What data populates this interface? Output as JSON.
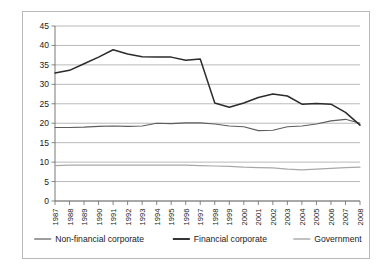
{
  "chart_data": {
    "type": "line",
    "title": "",
    "subtitle": "",
    "xlabel": "",
    "ylabel": "",
    "ylim": [
      0,
      45
    ],
    "y_ticks": [
      0,
      5,
      10,
      15,
      20,
      25,
      30,
      35,
      40,
      45
    ],
    "grid": true,
    "legend_position": "bottom",
    "x": [
      "1987",
      "1988",
      "1989",
      "1990",
      "1991",
      "1992",
      "1993",
      "1994",
      "1995",
      "1996",
      "1997",
      "1998",
      "1999",
      "2000",
      "2001",
      "2002",
      "2003",
      "2004",
      "2005",
      "2006",
      "2007",
      "2008"
    ],
    "series": [
      {
        "name": "Non-financial corporate",
        "color": "#5d5d5d",
        "stroke_width": 1.1,
        "values": [
          18.9,
          18.9,
          19.0,
          19.2,
          19.3,
          19.2,
          19.3,
          20.0,
          19.9,
          20.1,
          20.1,
          19.8,
          19.3,
          19.1,
          18.1,
          18.2,
          19.1,
          19.3,
          19.8,
          20.6,
          21.0,
          20.0
        ]
      },
      {
        "name": "Financial corporate",
        "color": "#2b2b2b",
        "stroke_width": 1.5,
        "values": [
          32.9,
          33.6,
          35.3,
          37.0,
          38.9,
          37.8,
          37.1,
          37.0,
          37.0,
          36.2,
          36.5,
          25.2,
          24.1,
          25.2,
          26.6,
          27.5,
          27.0,
          24.9,
          25.1,
          24.9,
          22.8,
          19.5
        ]
      },
      {
        "name": "Government",
        "color": "#a8a8a8",
        "stroke_width": 1.2,
        "values": [
          9.1,
          9.2,
          9.2,
          9.2,
          9.2,
          9.2,
          9.2,
          9.2,
          9.2,
          9.2,
          9.1,
          9.0,
          8.9,
          8.7,
          8.6,
          8.5,
          8.2,
          8.0,
          8.2,
          8.4,
          8.6,
          8.7
        ]
      }
    ]
  },
  "legend": {
    "items": [
      {
        "label": "Non-financial corporate",
        "color": "#5d5d5d",
        "stroke_width": 1.2
      },
      {
        "label": "Financial corporate",
        "color": "#2b2b2b",
        "stroke_width": 1.9
      },
      {
        "label": "Government",
        "color": "#a8a8a8",
        "stroke_width": 1.4
      }
    ]
  }
}
